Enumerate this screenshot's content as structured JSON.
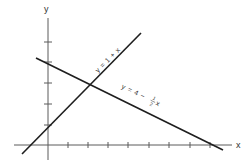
{
  "axes": {
    "x_label": "x",
    "y_label": "y",
    "x_ticks": [
      1,
      2,
      3,
      4,
      5,
      6,
      7,
      8
    ],
    "y_ticks": [
      1,
      2,
      3,
      4,
      5
    ]
  },
  "lines": [
    {
      "name": "line-1",
      "label": "y = 1 + x",
      "slope": 1,
      "intercept": 1
    },
    {
      "name": "line-2",
      "label_prefix": "y = 4 −",
      "label_frac_num": "1",
      "label_frac_den": "2",
      "label_suffix": "x",
      "slope": -0.5,
      "intercept": 4
    }
  ],
  "intersection": {
    "x": 2,
    "y": 3
  },
  "colors": {
    "axis": "#5a5a5a",
    "line": "#1e1e1e",
    "background": "#ffffff"
  }
}
